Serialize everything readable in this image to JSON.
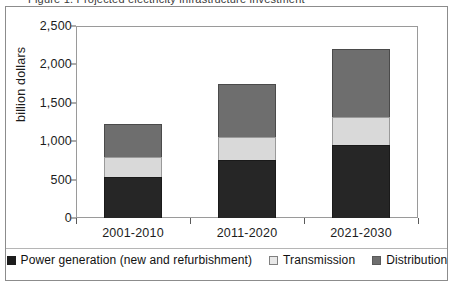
{
  "figure": {
    "top_cut_text": "Figure 1. Projected electricity infrastructure investment",
    "frame_color": "#8c8c8c"
  },
  "chart_data": {
    "type": "bar",
    "stacked": true,
    "title": "",
    "xlabel": "",
    "ylabel": "billion dollars",
    "categories": [
      "2001-2010",
      "2011-2020",
      "2021-2030"
    ],
    "ylim": [
      0,
      2500
    ],
    "ytick_labels": [
      "0",
      "500",
      "1,000",
      "1,500",
      "2,000",
      "2,500"
    ],
    "ytick_values": [
      0,
      500,
      1000,
      1500,
      2000,
      2500
    ],
    "grid": false,
    "legend_position": "bottom",
    "series": [
      {
        "name": "Power generation (new and refurbishment)",
        "color": "#262626",
        "values": [
          540,
          760,
          950
        ]
      },
      {
        "name": "Transmission",
        "color": "#d9d9d9",
        "values": [
          250,
          300,
          370
        ]
      },
      {
        "name": "Distribution",
        "color": "#6e6e6e",
        "values": [
          440,
          690,
          880
        ]
      }
    ],
    "totals": [
      1230,
      1750,
      2200
    ]
  }
}
